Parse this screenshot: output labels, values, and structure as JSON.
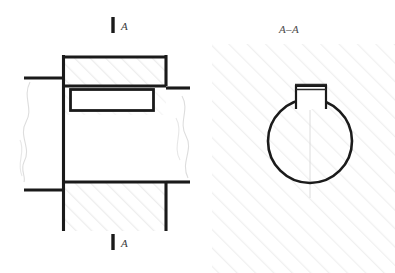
{
  "drawing": {
    "type": "engineering-section-drawing",
    "background_color": "#ffffff",
    "line_color": "#1a1a1a",
    "hatch_color": "#ededed",
    "breakline_color": "#dddddd",
    "views": [
      {
        "id": "longitudinal-section",
        "name": "left-view",
        "description": "longitudinal section of shaft with keyway and break lines",
        "section_marker_top": "A",
        "section_marker_bottom": "A"
      },
      {
        "id": "cross-section",
        "name": "right-view",
        "title": "A–A",
        "description": "A-A cross section showing circular shaft with rectangular keyway notch at top"
      }
    ],
    "labels": {
      "section_arrow_top": "A",
      "section_arrow_bottom": "A",
      "section_view_title": "A–A"
    },
    "geometry": {
      "left_view": {
        "upper_band": {
          "x": 62,
          "y": 56,
          "width": 104,
          "height": 29
        },
        "lower_band": {
          "x": 62,
          "y": 181,
          "width": 104,
          "height": 50
        },
        "keyway_rect": {
          "x": 70,
          "y": 88,
          "width": 84,
          "height": 22
        },
        "break_left_x": 25,
        "break_right_x": 183,
        "vertical_stub_left_x": 62,
        "vertical_stub_right_x": 166
      },
      "right_view": {
        "circle_center_x": 310,
        "circle_center_y": 141,
        "circle_radius": 42,
        "notch": {
          "x": 296,
          "y": 84,
          "width": 30,
          "height": 25
        },
        "hatch_field": {
          "x": 215,
          "y": 45,
          "width": 180,
          "height": 228
        }
      }
    }
  }
}
